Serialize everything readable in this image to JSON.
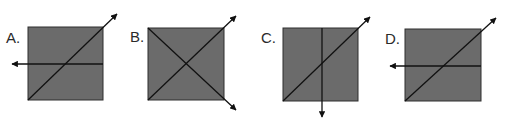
{
  "colors": {
    "square_fill": "#6b6b6b",
    "square_stroke": "#2e2e2e",
    "ray": "#111111",
    "label": "#2a2a2a",
    "background": "#ffffff"
  },
  "options": [
    {
      "label": "A.",
      "description": "Gray square; a diagonal ray from the bottom-left corner exits past the top-right corner with an arrowhead, and a horizontal ray runs from the right edge through the center, exiting the left side with an arrowhead.",
      "rays": [
        "diagonal bottom-left to upper-right (arrow up-right)",
        "horizontal right to left (arrow left)"
      ]
    },
    {
      "label": "B.",
      "description": "Gray square with both diagonals drawn; one exits past the top-right corner and the other past the bottom-right corner, each ending in an arrowhead.",
      "rays": [
        "diagonal bottom-left to upper-right (arrow up-right)",
        "diagonal top-left to lower-right (arrow down-right)"
      ]
    },
    {
      "label": "C.",
      "description": "Gray square; a diagonal ray from the bottom-left corner exits past the top-right corner with an arrowhead, and a vertical ray from the top edge through the center exits the bottom with an arrowhead.",
      "rays": [
        "diagonal bottom-left to upper-right (arrow up-right)",
        "vertical top to bottom (arrow down)"
      ]
    },
    {
      "label": "D.",
      "description": "Gray square; a diagonal ray from the bottom-left corner exits past the top-right corner with an arrowhead, and a horizontal ray runs from the right edge through the center, exiting the left side with an arrowhead.",
      "rays": [
        "diagonal bottom-left to upper-right (arrow up-right)",
        "horizontal right to left (arrow left)"
      ]
    }
  ]
}
